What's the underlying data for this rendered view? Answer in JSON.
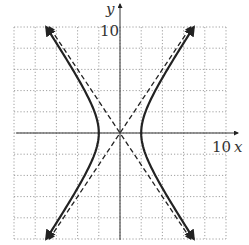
{
  "chart_data": {
    "type": "line",
    "title": "",
    "xlabel": "x",
    "ylabel": "y",
    "xlim": [
      -10,
      10
    ],
    "ylim": [
      -10,
      10
    ],
    "grid": true,
    "grid_step": 2,
    "grid_style": "dotted",
    "tick_labels": {
      "x": "10",
      "y": "10"
    },
    "equation": "x^2/4 - y^2/9 = 1",
    "series": [
      {
        "name": "hyperbola",
        "style": "solid",
        "arrows": true,
        "vertices": [
          [
            -2,
            0
          ],
          [
            2,
            0
          ]
        ]
      },
      {
        "name": "asymptote y = 1.5x",
        "style": "dashed",
        "slope": 1.5,
        "intercept": 0
      },
      {
        "name": "asymptote y = -1.5x",
        "style": "dashed",
        "slope": -1.5,
        "intercept": 0
      }
    ]
  },
  "labels": {
    "x_axis": "x",
    "y_axis": "y",
    "x_tick": "10",
    "y_tick": "10"
  },
  "colors": {
    "curve": "#222222",
    "grid": "#888888",
    "axis": "#333333"
  }
}
